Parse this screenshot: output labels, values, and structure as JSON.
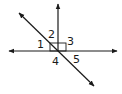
{
  "diagram": {
    "type": "angle-diagram",
    "stroke_color": "#1a1a1a",
    "background": "#ffffff",
    "labels": [
      {
        "id": "1",
        "text": "1",
        "x": 37,
        "y": 48
      },
      {
        "id": "2",
        "text": "2",
        "x": 48,
        "y": 38
      },
      {
        "id": "3",
        "text": "3",
        "x": 67,
        "y": 45
      },
      {
        "id": "4",
        "text": "4",
        "x": 52,
        "y": 65
      },
      {
        "id": "5",
        "text": "5",
        "x": 73,
        "y": 63
      }
    ],
    "right_angle_marker": true
  }
}
